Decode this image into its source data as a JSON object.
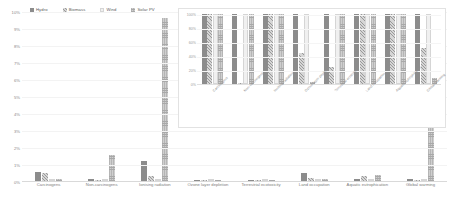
{
  "chart_data": {
    "type": "bar",
    "title": "",
    "xlabel": "",
    "ylabel": "",
    "ylim": [
      0,
      10
    ],
    "grid": true,
    "legend_position": "top-left",
    "ytick_labels": [
      "10%",
      "9%",
      "8%",
      "7%",
      "6%",
      "5%",
      "4%",
      "3%",
      "2%",
      "1%",
      "0%"
    ],
    "ytick_values": [
      10,
      9,
      8,
      7,
      6,
      5,
      4,
      3,
      2,
      1,
      0
    ],
    "categories": [
      "Carcinogens",
      "Non-carcinogens",
      "Ionising radiation",
      "Ozone layer depletion",
      "Terrestrial ecotoxicity",
      "Land occupation",
      "Aquatic eutrophication",
      "Global warming"
    ],
    "series": [
      {
        "name": "Hydro",
        "style": "s-hydro",
        "values": [
          0.55,
          0.1,
          1.15,
          0.04,
          0.05,
          0.45,
          0.1,
          0.12
        ]
      },
      {
        "name": "Biomass",
        "style": "s-biomass",
        "values": [
          0.45,
          0.08,
          0.3,
          0.03,
          0.04,
          0.2,
          0.3,
          0.08
        ]
      },
      {
        "name": "Wind",
        "style": "s-wind",
        "values": [
          0.1,
          0.05,
          0.1,
          0.02,
          0.02,
          0.08,
          0.06,
          0.05
        ]
      },
      {
        "name": "Solar PV",
        "style": "s-solar",
        "values": [
          0.12,
          1.55,
          9.6,
          0.06,
          0.03,
          0.12,
          0.35,
          4.05
        ]
      }
    ],
    "inset": {
      "type": "bar",
      "ylim": [
        0,
        100
      ],
      "ytick_labels": [
        "100%",
        "80%",
        "60%",
        "40%",
        "20%",
        "0%"
      ],
      "ytick_values": [
        100,
        80,
        60,
        40,
        20,
        0
      ],
      "categories": [
        "Carcinogens",
        "Non-carcinogens",
        "Ionising radiation",
        "Ozone layer depletion",
        "Terrestrial ecotoxicity",
        "Land occupation",
        "Aquatic eutrophication",
        "Global warming"
      ],
      "series": [
        {
          "name": "Hydro",
          "style": "s-hydro",
          "values": [
            100,
            100,
            100,
            100,
            100,
            100,
            100,
            100
          ]
        },
        {
          "name": "Biomass",
          "style": "s-biomass",
          "values": [
            100,
            2,
            100,
            45,
            25,
            100,
            100,
            52
          ]
        },
        {
          "name": "Wind",
          "style": "s-wind",
          "values": [
            100,
            100,
            100,
            100,
            100,
            100,
            100,
            100
          ]
        },
        {
          "name": "Solar PV",
          "style": "s-solar",
          "values": [
            100,
            100,
            100,
            3,
            100,
            100,
            100,
            8
          ]
        }
      ]
    }
  }
}
